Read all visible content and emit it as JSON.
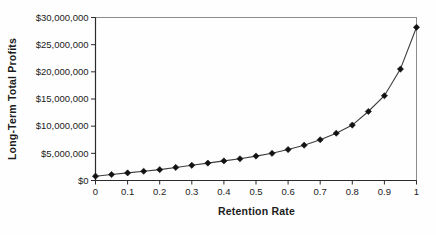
{
  "chart_data": {
    "type": "line",
    "title": "",
    "xlabel": "Retention Rate",
    "ylabel": "Long-Term Total Profits",
    "x": [
      0,
      0.05,
      0.1,
      0.15,
      0.2,
      0.25,
      0.3,
      0.35,
      0.4,
      0.45,
      0.5,
      0.55,
      0.6,
      0.65,
      0.7,
      0.75,
      0.8,
      0.85,
      0.9,
      0.95,
      1.0
    ],
    "series": [
      {
        "name": "Long-Term Total Profits",
        "values": [
          800000,
          1100000,
          1400000,
          1700000,
          2000000,
          2400000,
          2800000,
          3200000,
          3600000,
          4000000,
          4500000,
          5000000,
          5700000,
          6500000,
          7500000,
          8700000,
          10200000,
          12700000,
          15600000,
          20500000,
          28200000
        ]
      }
    ],
    "xlim": [
      0,
      1
    ],
    "ylim": [
      0,
      30000000
    ],
    "x_tick_values": [
      0,
      0.1,
      0.2,
      0.3,
      0.4,
      0.5,
      0.6,
      0.7,
      0.8,
      0.9,
      1
    ],
    "x_tick_labels": [
      "0",
      "0.1",
      "0.2",
      "0.3",
      "0.4",
      "0.5",
      "0.6",
      "0.7",
      "0.8",
      "0.9",
      "1"
    ],
    "y_tick_values": [
      0,
      5000000,
      10000000,
      15000000,
      20000000,
      25000000,
      30000000
    ],
    "y_tick_labels": [
      "$0",
      "$5,000,000",
      "$10,000,000",
      "$15,000,000",
      "$20,000,000",
      "$25,000,000",
      "$30,000,000"
    ],
    "grid": false,
    "legend": "none",
    "marker": "diamond",
    "colors": {
      "line": "#3d3d3d",
      "marker": "#121212",
      "axis": "#2b2b2b",
      "plot_border": "#8c8c8c",
      "text": "#1c1c1c",
      "background": "#fefefe"
    }
  }
}
